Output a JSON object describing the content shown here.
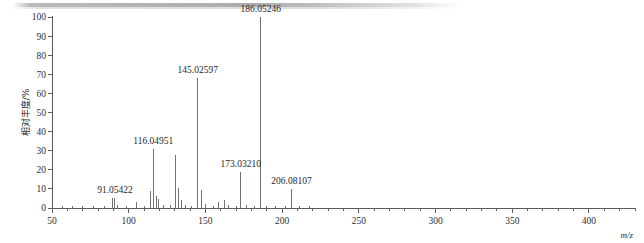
{
  "chart_data": {
    "type": "bar",
    "title": "",
    "subtitle": "",
    "xlabel": "m/z",
    "ylabel": "相对丰度/%",
    "xlim": [
      50,
      430
    ],
    "ylim": [
      0,
      100
    ],
    "grid": false,
    "legend": "none",
    "xticks": [
      50,
      100,
      150,
      200,
      250,
      300,
      350,
      400
    ],
    "xtick_labels": [
      "50",
      "100",
      "150",
      "200",
      "250",
      "300",
      "350",
      "400"
    ],
    "xminor_step": 10,
    "yticks": [
      0,
      10,
      20,
      30,
      40,
      50,
      60,
      70,
      80,
      90,
      100
    ],
    "ytick_labels": [
      "0",
      "10",
      "20",
      "30",
      "40",
      "50",
      "60",
      "70",
      "80",
      "90",
      "100"
    ],
    "labeled_peaks": [
      {
        "mz": 91.05422,
        "intensity": 5.0,
        "label": "91.05422"
      },
      {
        "mz": 116.04951,
        "intensity": 31.0,
        "label": "116.04951"
      },
      {
        "mz": 145.02597,
        "intensity": 68.0,
        "label": "145.02597"
      },
      {
        "mz": 173.0321,
        "intensity": 19.0,
        "label": "173.03210"
      },
      {
        "mz": 186.05246,
        "intensity": 100.0,
        "label": "186.05246"
      },
      {
        "mz": 206.08107,
        "intensity": 10.0,
        "label": "206.08107"
      }
    ],
    "unlabeled_peaks": [
      {
        "mz": 57.0,
        "intensity": 1.2
      },
      {
        "mz": 63.5,
        "intensity": 1.0
      },
      {
        "mz": 70.0,
        "intensity": 1.0
      },
      {
        "mz": 77.0,
        "intensity": 1.3
      },
      {
        "mz": 84.0,
        "intensity": 1.0
      },
      {
        "mz": 89.5,
        "intensity": 5.2
      },
      {
        "mz": 92.6,
        "intensity": 1.6
      },
      {
        "mz": 98.5,
        "intensity": 1.2
      },
      {
        "mz": 105.0,
        "intensity": 3.2
      },
      {
        "mz": 110.0,
        "intensity": 1.1
      },
      {
        "mz": 114.5,
        "intensity": 9.0
      },
      {
        "mz": 117.8,
        "intensity": 6.5
      },
      {
        "mz": 119.5,
        "intensity": 4.5
      },
      {
        "mz": 123.0,
        "intensity": 1.4
      },
      {
        "mz": 127.0,
        "intensity": 1.6
      },
      {
        "mz": 130.6,
        "intensity": 28.0
      },
      {
        "mz": 132.5,
        "intensity": 10.5
      },
      {
        "mz": 134.5,
        "intensity": 4.0
      },
      {
        "mz": 137.0,
        "intensity": 1.5
      },
      {
        "mz": 141.0,
        "intensity": 1.3
      },
      {
        "mz": 147.5,
        "intensity": 9.5
      },
      {
        "mz": 150.0,
        "intensity": 2.0
      },
      {
        "mz": 155.0,
        "intensity": 1.2
      },
      {
        "mz": 158.5,
        "intensity": 3.2
      },
      {
        "mz": 162.5,
        "intensity": 4.2
      },
      {
        "mz": 165.0,
        "intensity": 1.6
      },
      {
        "mz": 170.0,
        "intensity": 1.2
      },
      {
        "mz": 177.0,
        "intensity": 1.4
      },
      {
        "mz": 182.0,
        "intensity": 1.2
      },
      {
        "mz": 190.0,
        "intensity": 1.3
      },
      {
        "mz": 196.0,
        "intensity": 1.1
      },
      {
        "mz": 202.0,
        "intensity": 1.0
      },
      {
        "mz": 211.0,
        "intensity": 1.2
      },
      {
        "mz": 218.0,
        "intensity": 1.0
      }
    ],
    "colors": {
      "peak": "#6d7275",
      "axis": "#555b5e",
      "text": "#1f1f1f",
      "background": "#ffffff"
    }
  },
  "axes": {
    "x_title": "m/z",
    "y_title": "相对丰度/%"
  }
}
